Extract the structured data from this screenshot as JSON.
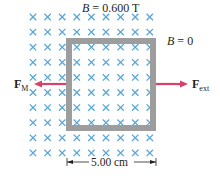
{
  "field_region": {
    "label_var": "B",
    "label_eq": " = ",
    "label_value": "0.600 T",
    "symbol": "cross",
    "symbol_meaning": "field into page",
    "columns": 9,
    "rows": 10,
    "color": "#5aa6d6"
  },
  "outside_region": {
    "label_var": "B",
    "label_eq": " = ",
    "label_value": "0"
  },
  "loop": {
    "color": "#9d9d9d",
    "side_length_label": "5.00 cm"
  },
  "forces": {
    "magnetic": {
      "symbol": "F",
      "subscript": "M",
      "direction": "left",
      "color": "#d9416b"
    },
    "external": {
      "symbol": "F",
      "subscript": "ext",
      "direction": "right",
      "color": "#d9416b"
    }
  }
}
